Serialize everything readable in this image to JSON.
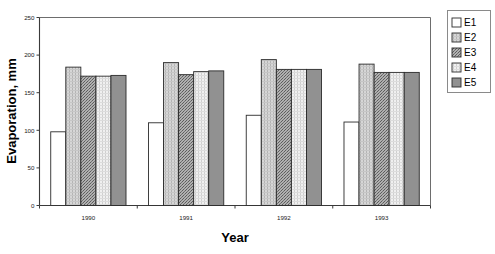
{
  "chart_data": {
    "type": "bar",
    "title": "",
    "xlabel": "Year",
    "ylabel": "Evaporation, mm",
    "categories": [
      "1990",
      "1991",
      "1992",
      "1993"
    ],
    "ylim": [
      0,
      250
    ],
    "yticks": [
      0,
      50,
      100,
      150,
      200,
      250
    ],
    "ytick_labels": [
      "0",
      "50",
      "100",
      "150",
      "200",
      "250"
    ],
    "grid": false,
    "legend_position": "right",
    "series": [
      {
        "name": "E1",
        "values": [
          98,
          110,
          120,
          111
        ],
        "fill": "white-empty"
      },
      {
        "name": "E2",
        "values": [
          184,
          190,
          194,
          188
        ],
        "fill": "light-vertical-stripes"
      },
      {
        "name": "E3",
        "values": [
          172,
          174,
          181,
          177
        ],
        "fill": "dark-dot-stipple"
      },
      {
        "name": "E4",
        "values": [
          172,
          178,
          181,
          177
        ],
        "fill": "pale-crosshatch"
      },
      {
        "name": "E5",
        "values": [
          173,
          179,
          181,
          177
        ],
        "fill": "solid-gray"
      }
    ]
  },
  "legend": {
    "entries": [
      "E1",
      "E2",
      "E3",
      "E4",
      "E5"
    ]
  },
  "colors": {
    "axis": "#3a3a3a",
    "frame": "#6d6d6d",
    "bar_outline": "#2b2b2b",
    "e1": "#ffffff",
    "e2": "#c9c9c9",
    "e3": "#9a9a9a",
    "e4": "#e4e4e4",
    "e5": "#8f8f8f",
    "text": "#000000"
  }
}
